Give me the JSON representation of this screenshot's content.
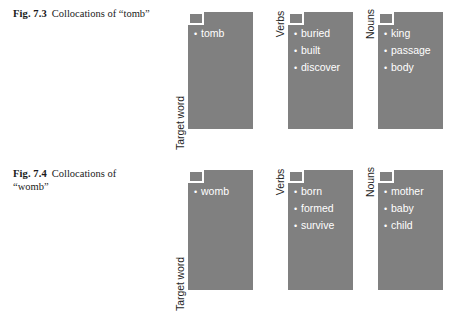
{
  "figures": [
    {
      "caption_number": "Fig. 7.3",
      "caption_text": "Collocations of “tomb”",
      "groups": [
        {
          "label": "Target word",
          "bullet": "•",
          "items": [
            "tomb"
          ]
        },
        {
          "label": "Verbs",
          "bullet": "•",
          "items": [
            "buried",
            "built",
            "discover"
          ]
        },
        {
          "label": "Nouns",
          "bullet": "•",
          "items": [
            "king",
            "passage",
            "body"
          ]
        }
      ]
    },
    {
      "caption_number": "Fig. 7.4",
      "caption_text": "Collocations of “womb”",
      "groups": [
        {
          "label": "Target word",
          "bullet": "•",
          "items": [
            "womb"
          ]
        },
        {
          "label": "Verbs",
          "bullet": "•",
          "items": [
            "born",
            "formed",
            "survive"
          ]
        },
        {
          "label": "Nouns",
          "bullet": "•",
          "items": [
            "mother",
            "baby",
            "child"
          ]
        }
      ]
    }
  ],
  "colors": {
    "panel_fill": "#808080",
    "panel_text": "#ffffff",
    "caption_text": "#1a1a1a",
    "background": "#ffffff"
  }
}
